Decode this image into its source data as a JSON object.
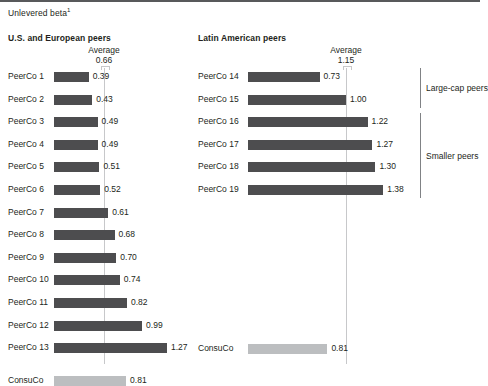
{
  "subtitle": "Unlevered beta",
  "subtitle_footnote": "1",
  "chart_data": {
    "type": "bar",
    "title": "Unlevered beta",
    "xlabel": "",
    "ylabel": "",
    "orientation": "horizontal",
    "grid": false,
    "legend": "none",
    "panels": [
      {
        "title": "U.S. and European peers",
        "average_label": "Average",
        "average_value": "0.66",
        "average": 0.66,
        "xlim": [
          0,
          1.45
        ],
        "categories": [
          "PeerCo 1",
          "PeerCo 2",
          "PeerCo 3",
          "PeerCo 4",
          "PeerCo 5",
          "PeerCo 6",
          "PeerCo 7",
          "PeerCo 8",
          "PeerCo 9",
          "PeerCo 10",
          "PeerCo 11",
          "PeerCo 12",
          "PeerCo 13",
          "ConsuCo"
        ],
        "values": [
          0.39,
          0.43,
          0.49,
          0.49,
          0.51,
          0.52,
          0.61,
          0.68,
          0.7,
          0.74,
          0.82,
          0.99,
          1.27,
          0.81
        ],
        "labels": [
          "0.39",
          "0.43",
          "0.49",
          "0.49",
          "0.51",
          "0.52",
          "0.61",
          "0.68",
          "0.70",
          "0.74",
          "0.82",
          "0.99",
          "1.27",
          "0.81"
        ],
        "highlight_index": 13
      },
      {
        "title": "Latin American peers",
        "average_label": "Average",
        "average_value": "1.15",
        "average": 1.15,
        "xlim": [
          0,
          1.55
        ],
        "categories": [
          "PeerCo 14",
          "PeerCo 15",
          "PeerCo 16",
          "PeerCo 17",
          "PeerCo 18",
          "PeerCo 19",
          "ConsuCo"
        ],
        "values": [
          0.73,
          1.0,
          1.22,
          1.27,
          1.3,
          1.38,
          0.81
        ],
        "labels": [
          "0.73",
          "1.00",
          "1.22",
          "1.27",
          "1.30",
          "1.38",
          "0.81"
        ],
        "highlight_index": 6,
        "brackets": [
          {
            "label": "Large-cap peers",
            "from": 0,
            "to": 1
          },
          {
            "label": "Smaller peers",
            "from": 2,
            "to": 5
          }
        ]
      }
    ],
    "colors": {
      "bar": "#4d4d4f",
      "highlight": "#bcbec0",
      "average_line": "#c7c8ca",
      "rule": "#58595b"
    }
  }
}
